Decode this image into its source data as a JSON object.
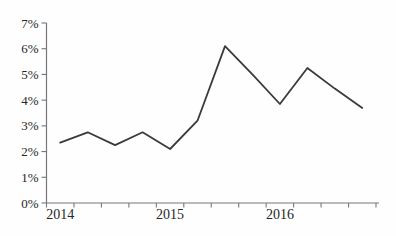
{
  "chart_data": {
    "type": "line",
    "title": "",
    "xlabel": "",
    "ylabel": "",
    "categories": [
      "2014 Q1",
      "2014 Q2",
      "2014 Q3",
      "2014 Q4",
      "2015 Q1",
      "2015 Q2",
      "2015 Q3",
      "2015 Q4",
      "2016 Q1",
      "2016 Q2",
      "2016 Q3",
      "2016 Q4"
    ],
    "values": [
      2.35,
      2.75,
      2.25,
      2.75,
      2.1,
      3.2,
      6.1,
      5.0,
      3.85,
      5.25,
      4.45,
      3.7
    ],
    "unit": "percent",
    "ylim": [
      0,
      7
    ],
    "y_tick_labels": [
      "0%",
      "1%",
      "2%",
      "3%",
      "4%",
      "5%",
      "6%",
      "7%"
    ],
    "x_year_labels": [
      {
        "label": "2014",
        "point_index": 0
      },
      {
        "label": "2015",
        "point_index": 4
      },
      {
        "label": "2016",
        "point_index": 8
      }
    ],
    "grid": false,
    "legend": false,
    "line_color": "#3a3a3a",
    "axis_color": "#777777",
    "label_color": "#262626",
    "background": "#fefefe"
  }
}
